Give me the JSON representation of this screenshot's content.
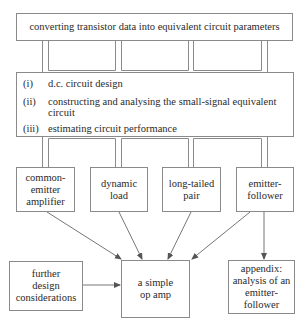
{
  "top": {
    "label": "converting transistor data into equivalent circuit parameters"
  },
  "middle": {
    "items": [
      {
        "num": "(i)",
        "text": "d.c. circuit design"
      },
      {
        "num": "(ii)",
        "text": "constructing and analysing the small-signal equivalent circuit"
      },
      {
        "num": "(iii)",
        "text": "estimating circuit performance"
      }
    ]
  },
  "row": {
    "boxes": [
      {
        "label": "common-\nemitter\namplifier"
      },
      {
        "label": "dynamic\nload"
      },
      {
        "label": "long-tailed\npair"
      },
      {
        "label": "emitter-\nfollower"
      }
    ]
  },
  "bottom": {
    "further": {
      "label": "further\ndesign\nconsiderations"
    },
    "opamp": {
      "label": "a simple\nop amp"
    },
    "appendix": {
      "label": "appendix:\nanalysis of an\nemitter-\nfollower"
    }
  },
  "colors": {
    "line": "#8a8a8a",
    "text": "#2a2a2a",
    "arrow": "#555555"
  }
}
